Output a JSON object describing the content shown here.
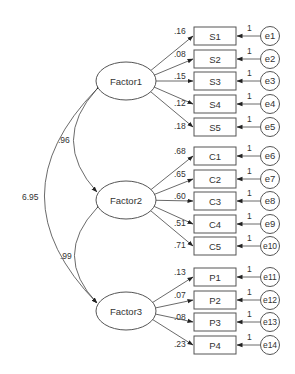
{
  "diagram": {
    "type": "structural-equation-model (CFA path diagram)",
    "colors": {
      "stroke": "#555555",
      "text": "#333333",
      "background": "#ffffff"
    },
    "factors": [
      {
        "id": "Factor1",
        "label": "Factor1",
        "cx": 126,
        "cy": 81
      },
      {
        "id": "Factor2",
        "label": "Factor2",
        "cx": 126,
        "cy": 200
      },
      {
        "id": "Factor3",
        "label": "Factor3",
        "cx": 126,
        "cy": 311
      }
    ],
    "indicators": [
      {
        "id": "S1",
        "label": "S1",
        "factor": "Factor1",
        "y": 36,
        "loading": ".16",
        "error": "e1",
        "error_weight": "1"
      },
      {
        "id": "S2",
        "label": "S2",
        "factor": "Factor1",
        "y": 59,
        "loading": ".08",
        "error": "e2",
        "error_weight": "1"
      },
      {
        "id": "S3",
        "label": "S3",
        "factor": "Factor1",
        "y": 81,
        "loading": ".15",
        "error": "e3",
        "error_weight": "1"
      },
      {
        "id": "S4",
        "label": "S4",
        "factor": "Factor1",
        "y": 104,
        "loading": ".12",
        "error": "e4",
        "error_weight": "1"
      },
      {
        "id": "S5",
        "label": "S5",
        "factor": "Factor1",
        "y": 127,
        "loading": ".18",
        "error": "e5",
        "error_weight": "1"
      },
      {
        "id": "C1",
        "label": "C1",
        "factor": "Factor2",
        "y": 156,
        "loading": ".68",
        "error": "e6",
        "error_weight": "1"
      },
      {
        "id": "C2",
        "label": "C2",
        "factor": "Factor2",
        "y": 179,
        "loading": ".65",
        "error": "e7",
        "error_weight": "1"
      },
      {
        "id": "C3",
        "label": "C3",
        "factor": "Factor2",
        "y": 201,
        "loading": ".60",
        "error": "e8",
        "error_weight": "1"
      },
      {
        "id": "C4",
        "label": "C4",
        "factor": "Factor2",
        "y": 224,
        "loading": ".51",
        "error": "e9",
        "error_weight": "1"
      },
      {
        "id": "C5",
        "label": "C5",
        "factor": "Factor2",
        "y": 246,
        "loading": ".71",
        "error": "e10",
        "error_weight": "1"
      },
      {
        "id": "P1",
        "label": "P1",
        "factor": "Factor3",
        "y": 277,
        "loading": ".13",
        "error": "e11",
        "error_weight": "1"
      },
      {
        "id": "P2",
        "label": "P2",
        "factor": "Factor3",
        "y": 300,
        "loading": ".07",
        "error": "e12",
        "error_weight": "1"
      },
      {
        "id": "P3",
        "label": "P3",
        "factor": "Factor3",
        "y": 322,
        "loading": ".08",
        "error": "e13",
        "error_weight": "1"
      },
      {
        "id": "P4",
        "label": "P4",
        "factor": "Factor3",
        "y": 345,
        "loading": ".23",
        "error": "e14",
        "error_weight": "1"
      }
    ],
    "covariances": [
      {
        "from": "Factor1",
        "to": "Factor2",
        "value": ".96",
        "ctrl_x": 50,
        "label_x": 58,
        "label_y": 143
      },
      {
        "from": "Factor2",
        "to": "Factor3",
        "value": ".99",
        "ctrl_x": 52,
        "label_x": 60,
        "label_y": 259
      },
      {
        "from": "Factor1",
        "to": "Factor3",
        "value": "6.95",
        "ctrl_x": -8,
        "label_x": 22,
        "label_y": 200
      }
    ]
  }
}
